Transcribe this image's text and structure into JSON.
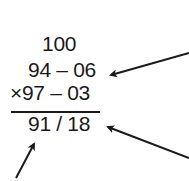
{
  "diagram": {
    "base": "100",
    "rows": [
      {
        "label": "94 – 06"
      },
      {
        "label": "97 – 03",
        "operator": "×"
      }
    ],
    "result": "91 / 18",
    "arrows": [
      {
        "from": [
          189,
          53
        ],
        "to": [
          110,
          75
        ],
        "points_to": "94 – 06"
      },
      {
        "from": [
          189,
          158
        ],
        "to": [
          107,
          127
        ],
        "points_to": "18"
      },
      {
        "from": [
          16,
          178
        ],
        "to": [
          34,
          143
        ],
        "points_to": "91"
      }
    ],
    "colors": {
      "text": "#1a1a1a",
      "background": "#ffffff"
    }
  }
}
